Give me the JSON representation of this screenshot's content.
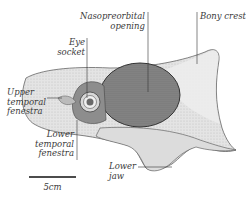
{
  "diagram": {
    "colors": {
      "line": "#555555",
      "bone_light": "#e6e6e6",
      "bone_mid": "#cfcfcf",
      "opening_dark": "#7a7a7a",
      "eye": "#9a9a9a",
      "text": "#3a3a3a"
    },
    "labels": {
      "nasopreorbital": "Nasopreorbital\nopening",
      "bony_crest": "Bony crest",
      "eye_socket": "Eye\nsocket",
      "upper_temporal": "Upper\ntemporal\nfenestra",
      "lower_temporal": "Lower\ntemporal\nfenestra",
      "lower_jaw": "Lower\njaw"
    },
    "scale_bar": {
      "label": "5cm"
    }
  }
}
